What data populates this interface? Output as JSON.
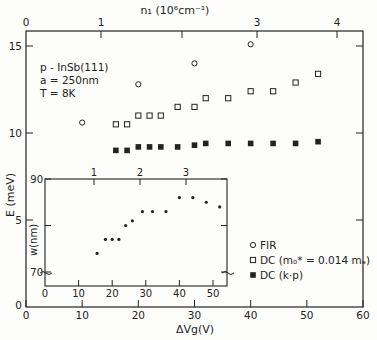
{
  "chart_data": [
    {
      "type": "scatter",
      "title": "",
      "xlabel": "ΔVg(V)",
      "ylabel": "E (meV)",
      "xlim": [
        0,
        60
      ],
      "ylim": [
        0,
        16.5
      ],
      "x_ticks": [
        0,
        10,
        20,
        30,
        40,
        50,
        60
      ],
      "y_ticks": [
        0,
        5,
        10,
        15
      ],
      "top_axis": {
        "label": "n₁ (10⁶cm⁻¹)",
        "ticks": [
          {
            "label": "0",
            "x_px": 26
          },
          {
            "label": "1",
            "x_px": 101
          },
          {
            "label": "",
            "x_px": 182
          },
          {
            "label": "3",
            "x_px": 257
          },
          {
            "label": "4",
            "x_px": 337
          }
        ]
      },
      "grid": false,
      "annotation": [
        "p - InSb(111)",
        "a = 250nm",
        "T = 8K"
      ],
      "legend_position": "lower right",
      "series": [
        {
          "name": "FIR",
          "marker": "open-circle",
          "x": [
            10,
            20,
            30,
            40
          ],
          "y": [
            10.6,
            12.8,
            14.0,
            15.1
          ]
        },
        {
          "name": "DC (m₀* = 0.014 mₑ)",
          "marker": "open-square",
          "x": [
            16,
            18,
            20,
            22,
            24,
            27,
            30,
            32,
            36,
            40,
            44,
            48,
            52
          ],
          "y": [
            10.5,
            10.5,
            11.0,
            11.0,
            11.0,
            11.5,
            11.5,
            12.0,
            12.0,
            12.4,
            12.4,
            12.9,
            13.4
          ]
        },
        {
          "name": "DC (k·p)",
          "marker": "filled-square",
          "x": [
            16,
            18,
            20,
            22,
            24,
            27,
            30,
            32,
            36,
            40,
            44,
            48,
            52
          ],
          "y": [
            9.0,
            9.0,
            9.2,
            9.2,
            9.2,
            9.2,
            9.3,
            9.4,
            9.4,
            9.4,
            9.4,
            9.4,
            9.5
          ]
        }
      ]
    },
    {
      "type": "scatter",
      "title": "inset",
      "xlabel": "",
      "ylabel": "w (nm)",
      "xlim": [
        0,
        54
      ],
      "ylim": [
        68,
        90
      ],
      "x_ticks": [
        0,
        10,
        20,
        30,
        40,
        50
      ],
      "y_ticks": [
        70,
        90
      ],
      "top_axis": {
        "ticks": [
          {
            "label": "1",
            "x_px": 94
          },
          {
            "label": "2",
            "x_px": 140
          },
          {
            "label": "3",
            "x_px": 186
          }
        ]
      },
      "axis_break": true,
      "series": [
        {
          "name": "w",
          "marker": "filled-dot",
          "x": [
            15.5,
            18,
            20,
            22,
            24,
            26,
            29,
            32,
            36,
            40,
            44,
            48,
            52
          ],
          "y": [
            74,
            77,
            77,
            77,
            80,
            81,
            83,
            83,
            83,
            86,
            86,
            85,
            84
          ]
        }
      ]
    }
  ],
  "labels": {
    "top_axis_title": "n₁ (10⁶cm⁻¹)",
    "x_axis_title": "ΔVg(V)",
    "y_axis_title": "E (meV)",
    "inset_y_title": "w(nm)",
    "annotation_line1": "p - InSb(111)",
    "annotation_line2": "a = 250nm",
    "annotation_line3": "T = 8K",
    "legend_fir": "FIR",
    "legend_dc_mass": "DC (m₀* = 0.014 mₑ)",
    "legend_dc_kp": "DC (k·p)"
  }
}
